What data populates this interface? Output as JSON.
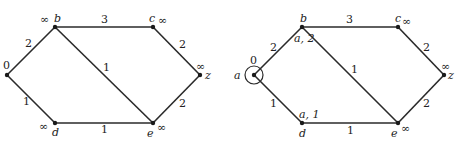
{
  "graphs": [
    {
      "id": "initial",
      "nodes": [
        {
          "name": "a",
          "x": 7,
          "y": 75,
          "label": "",
          "dist": "0",
          "label_x": 0,
          "label_y": 78,
          "dist_x": 3,
          "dist_y": 69
        },
        {
          "name": "b",
          "x": 55,
          "y": 27,
          "label": "b",
          "dist": "∞",
          "label_x": 54,
          "label_y": 22,
          "dist_x": 40,
          "dist_y": 23
        },
        {
          "name": "c",
          "x": 153,
          "y": 27,
          "label": "c",
          "dist": "∞",
          "label_x": 149,
          "label_y": 22,
          "dist_x": 158,
          "dist_y": 24
        },
        {
          "name": "z",
          "x": 200,
          "y": 75,
          "label": "z",
          "dist": "∞",
          "label_x": 205,
          "label_y": 79,
          "dist_x": 196,
          "dist_y": 70
        },
        {
          "name": "d",
          "x": 55,
          "y": 123,
          "label": "d",
          "dist": "∞",
          "label_x": 52,
          "label_y": 136,
          "dist_x": 39,
          "dist_y": 130
        },
        {
          "name": "e",
          "x": 153,
          "y": 123,
          "label": "e",
          "dist": "∞",
          "label_x": 147,
          "label_y": 137,
          "dist_x": 157,
          "dist_y": 131
        }
      ],
      "edges": [
        {
          "from": "a",
          "to": "b",
          "weight": "2",
          "wx": 25,
          "wy": 47
        },
        {
          "from": "b",
          "to": "c",
          "weight": "3",
          "wx": 101,
          "wy": 23
        },
        {
          "from": "c",
          "to": "z",
          "weight": "2",
          "wx": 179,
          "wy": 48
        },
        {
          "from": "a",
          "to": "d",
          "weight": "1",
          "wx": 23,
          "wy": 105
        },
        {
          "from": "d",
          "to": "e",
          "weight": "1",
          "wx": 101,
          "wy": 133
        },
        {
          "from": "e",
          "to": "z",
          "weight": "2",
          "wx": 179,
          "wy": 107
        },
        {
          "from": "b",
          "to": "e",
          "weight": "1",
          "wx": 103,
          "wy": 71
        }
      ]
    },
    {
      "id": "after-step-1",
      "nodes": [
        {
          "name": "a",
          "x": 254,
          "y": 75,
          "label": "a",
          "dist": "0",
          "label_x": 234,
          "label_y": 79,
          "dist_x": 250,
          "dist_y": 64,
          "circled": true
        },
        {
          "name": "b",
          "x": 302,
          "y": 27,
          "label": "b",
          "dist": "a, 2",
          "label_x": 300,
          "label_y": 22,
          "dist_x": 294,
          "dist_y": 42
        },
        {
          "name": "c",
          "x": 398,
          "y": 27,
          "label": "c",
          "dist": "∞",
          "label_x": 395,
          "label_y": 22,
          "dist_x": 402,
          "dist_y": 25
        },
        {
          "name": "z",
          "x": 444,
          "y": 75,
          "label": "z",
          "dist": "∞",
          "label_x": 448,
          "label_y": 79,
          "dist_x": 441,
          "dist_y": 70
        },
        {
          "name": "d",
          "x": 302,
          "y": 123,
          "label": "d",
          "dist": "a, 1",
          "label_x": 299,
          "label_y": 137,
          "dist_x": 299,
          "dist_y": 118
        },
        {
          "name": "e",
          "x": 398,
          "y": 123,
          "label": "e",
          "dist": "∞",
          "label_x": 391,
          "label_y": 137,
          "dist_x": 401,
          "dist_y": 132
        }
      ],
      "edges": [
        {
          "from": "a",
          "to": "b",
          "weight": "2",
          "wx": 270,
          "wy": 51
        },
        {
          "from": "b",
          "to": "c",
          "weight": "3",
          "wx": 346,
          "wy": 23
        },
        {
          "from": "c",
          "to": "z",
          "weight": "2",
          "wx": 423,
          "wy": 51
        },
        {
          "from": "a",
          "to": "d",
          "weight": "1",
          "wx": 270,
          "wy": 107
        },
        {
          "from": "d",
          "to": "e",
          "weight": "1",
          "wx": 347,
          "wy": 134
        },
        {
          "from": "e",
          "to": "z",
          "weight": "2",
          "wx": 423,
          "wy": 107
        },
        {
          "from": "b",
          "to": "e",
          "weight": "1",
          "wx": 351,
          "wy": 73
        }
      ]
    }
  ]
}
